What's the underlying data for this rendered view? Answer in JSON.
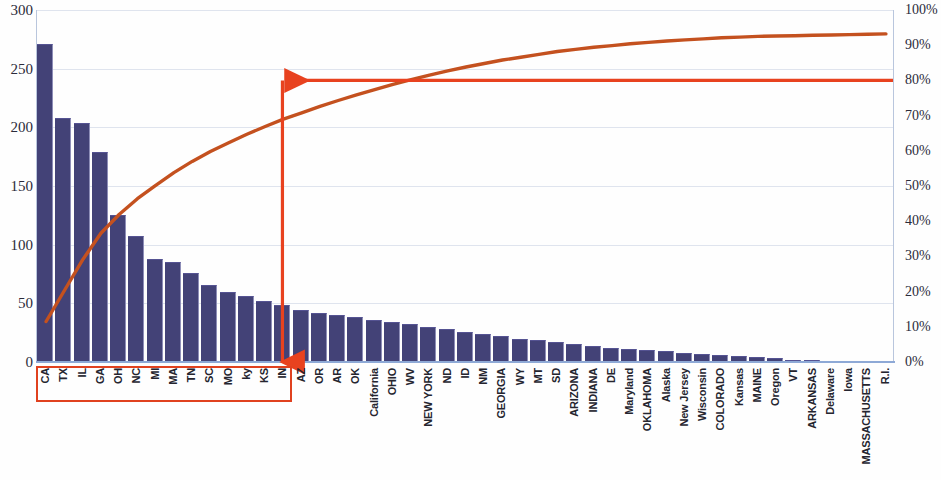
{
  "chart_data": {
    "type": "bar",
    "title": "",
    "subtitle": "",
    "xlabel": "",
    "ylabel": "",
    "y2label": "",
    "grid": true,
    "legend_position": "none",
    "ylim": [
      0,
      300
    ],
    "y2lim": [
      0,
      100
    ],
    "yticks": [
      300,
      250,
      200,
      150,
      100,
      50,
      0
    ],
    "y2ticks": [
      "100%",
      "90%",
      "80%",
      "70%",
      "60%",
      "50%",
      "40%",
      "30%",
      "20%",
      "10%",
      "0%"
    ],
    "categories": [
      "CA",
      "TX",
      "IL",
      "GA",
      "OH",
      "NC",
      "MI",
      "MA",
      "TN",
      "SC",
      "MO",
      "ky",
      "KS",
      "IN",
      "AZ",
      "OR",
      "AR",
      "OK",
      "California",
      "OHIO",
      "WV",
      "NEW YORK",
      "ND",
      "ID",
      "NM",
      "GEORGIA",
      "WY",
      "MT",
      "SD",
      "ARIZONA",
      "INDIANA",
      "DE",
      "Maryland",
      "OKLAHOMA",
      "Alaska",
      "New Jersey",
      "Wisconsin",
      "COLORADO",
      "Kansas",
      "MAINE",
      "Oregon",
      "VT",
      "ARKANSAS",
      "Delaware",
      "Iowa",
      "MASSACHUSETTS",
      "R.I."
    ],
    "series": [
      {
        "name": "Count",
        "type": "bar",
        "color": "#434277",
        "values": [
          271,
          208,
          204,
          179,
          125,
          107,
          88,
          85,
          76,
          66,
          60,
          56,
          52,
          49,
          44,
          42,
          40,
          38,
          36,
          34,
          32,
          30,
          28,
          26,
          24,
          22,
          20,
          19,
          17,
          15,
          14,
          12,
          11,
          10,
          9,
          8,
          7,
          6,
          5,
          4,
          3,
          2,
          2,
          1,
          1,
          1,
          1
        ]
      },
      {
        "name": "Cumulative %",
        "type": "line",
        "color": "#c4511f",
        "values": [
          11.5,
          20.3,
          29.0,
          36.6,
          41.9,
          46.4,
          50.2,
          53.8,
          57.0,
          59.8,
          62.3,
          64.7,
          66.9,
          69.0,
          70.8,
          72.6,
          74.3,
          75.9,
          77.4,
          78.9,
          80.2,
          81.5,
          82.7,
          83.8,
          84.8,
          85.8,
          86.6,
          87.4,
          88.2,
          88.8,
          89.4,
          89.9,
          90.4,
          90.8,
          91.2,
          91.5,
          91.8,
          92.1,
          92.3,
          92.5,
          92.6,
          92.7,
          92.8,
          92.9,
          93.0,
          93.1,
          93.2
        ]
      }
    ],
    "annotations": [
      {
        "name": "eighty-percent-reference",
        "kind": "arrow-horizontal",
        "value": "80%",
        "color": "#e8421f",
        "from_axis": "right",
        "to_category": "IN"
      },
      {
        "name": "vital-few-drop-line",
        "kind": "arrow-vertical",
        "color": "#e8421f",
        "at_category": "IN"
      },
      {
        "name": "vital-few-highlight",
        "kind": "box",
        "color": "#e0411f",
        "covers_categories": [
          "CA",
          "TX",
          "IL",
          "GA",
          "OH",
          "NC",
          "MI",
          "MA",
          "TN",
          "SC",
          "MO",
          "ky",
          "KS",
          "IN"
        ]
      }
    ]
  },
  "colors": {
    "bar": "#434277",
    "bar_edge": "#8e8eb8",
    "curve": "#c4511f",
    "annotation": "#e8421f",
    "highlight_box": "#e0411f",
    "grid": "#dfe4ee",
    "axis": "#8ea9d6",
    "tick_text": "#2b2b3a"
  }
}
